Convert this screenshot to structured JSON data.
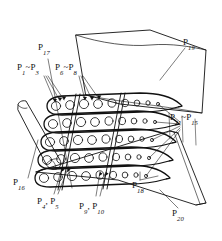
{
  "figure": {
    "type": "patent-line-drawing",
    "background_color": "#ffffff",
    "line_color": "#111111",
    "blade_count": 5,
    "cooling_holes_per_blade": 9
  },
  "labels": {
    "p1_p5": {
      "prefix": "P",
      "sub1": "1",
      "tilde": "~",
      "prefix2": "P",
      "sub2": "3",
      "text": "P1~P3"
    },
    "p6_p8": {
      "prefix": "P",
      "sub1": "6",
      "tilde": "~",
      "prefix2": "P",
      "sub2": "8",
      "text": "P6~P8"
    },
    "p11_p15": {
      "prefix": "P",
      "sub1": "11",
      "tilde": "~",
      "prefix2": "P",
      "sub2": "15",
      "text": "P11~P15"
    },
    "p4_p5": {
      "prefix": "P",
      "sub1": "4",
      "comma": ",",
      "prefix2": "P",
      "sub2": "5",
      "text": "P4, P5"
    },
    "p9_p10": {
      "prefix": "P",
      "sub1": "9",
      "comma": ",",
      "prefix2": "P",
      "sub2": "10",
      "text": "P9, P10"
    },
    "p16": {
      "prefix": "P",
      "sub1": "16",
      "text": "P16"
    },
    "p17": {
      "prefix": "P",
      "sub1": "17",
      "text": "P17"
    },
    "p18": {
      "prefix": "P",
      "sub1": "18",
      "text": "P18"
    },
    "p19": {
      "prefix": "P",
      "sub1": "19",
      "text": "P19"
    },
    "p20": {
      "prefix": "P",
      "sub1": "20",
      "text": "P20"
    }
  }
}
